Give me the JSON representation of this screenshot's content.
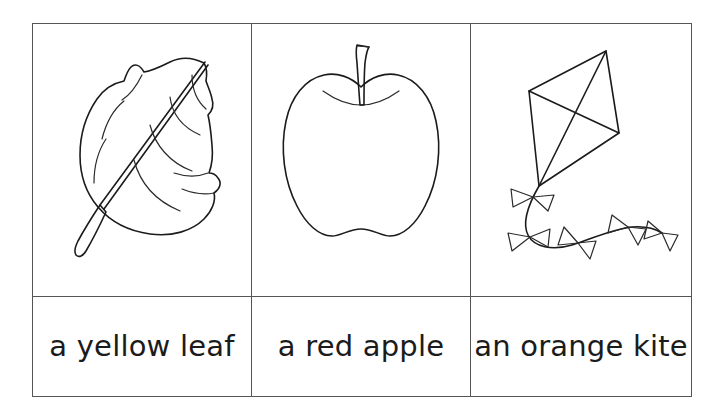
{
  "worksheet": {
    "columns": [
      {
        "picture": {
          "icon": "leaf-line-drawing",
          "alt": "leaf"
        },
        "label": "a yellow leaf"
      },
      {
        "picture": {
          "icon": "apple-line-drawing",
          "alt": "apple"
        },
        "label": "a red apple"
      },
      {
        "picture": {
          "icon": "kite-line-drawing",
          "alt": "kite"
        },
        "label": "an orange kite"
      }
    ],
    "colors": {
      "ink": "#1b1b1b",
      "border": "#555555",
      "background": "#ffffff"
    }
  }
}
